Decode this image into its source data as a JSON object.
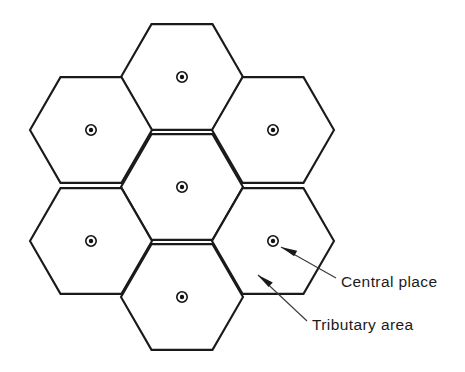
{
  "figure": {
    "background_color": "#ffffff",
    "line_color": "#1a1a1a",
    "label_color": "#1b1b1b",
    "leader_color": "#3b3b3b"
  },
  "lattice": {
    "type": "flat-top-hexagon",
    "cell_count": 7,
    "circumradius": 61,
    "cells": [
      {
        "id": "cell-top",
        "position_name": "top",
        "cx": 182,
        "cy": 77
      },
      {
        "id": "cell-upper-left",
        "position_name": "upper-left",
        "cx": 91,
        "cy": 130
      },
      {
        "id": "cell-upper-right",
        "position_name": "upper-right",
        "cx": 273,
        "cy": 130
      },
      {
        "id": "cell-center",
        "position_name": "center",
        "cx": 182,
        "cy": 187
      },
      {
        "id": "cell-lower-left",
        "position_name": "lower-left",
        "cx": 91,
        "cy": 241
      },
      {
        "id": "cell-lower-right",
        "position_name": "lower-right",
        "cx": 273,
        "cy": 241
      },
      {
        "id": "cell-bottom",
        "position_name": "bottom",
        "cx": 182,
        "cy": 297
      }
    ]
  },
  "marker": {
    "name": "central-place-symbol",
    "description": "filled dot inside a ring",
    "ring_radius": 5.2,
    "gap_radius": 3.6,
    "dot_radius": 2.2
  },
  "annotations": [
    {
      "id": "central-place",
      "label": "Central place",
      "text_x": 341,
      "text_y": 283,
      "leader": {
        "x1": 336,
        "y1": 278,
        "x2": 281,
        "y2": 247
      },
      "arrow_at": {
        "x": 281,
        "y": 247
      }
    },
    {
      "id": "tributary-area",
      "label": "Tributary area",
      "text_x": 312,
      "text_y": 326,
      "leader": {
        "x1": 307,
        "y1": 321,
        "x2": 258,
        "y2": 275
      },
      "arrow_at": {
        "x": 258,
        "y": 275
      }
    }
  ]
}
